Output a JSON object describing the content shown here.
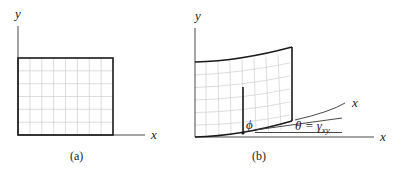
{
  "figure": {
    "panel_a": {
      "caption": "(a)",
      "x_axis_label": "x",
      "y_axis_label": "y",
      "grid": {
        "columns": 8,
        "rows": 6
      }
    },
    "panel_b": {
      "caption": "(b)",
      "x_axis_label": "x",
      "y_axis_label": "y",
      "rotated_x_label": "x",
      "phi_label": "ϕ",
      "theta_label": "θ = γ",
      "theta_subscript": "xy",
      "grid": {
        "columns": 8,
        "rows": 6
      }
    },
    "colors": {
      "line": "#1a1a1a",
      "grid": "#c8c8c8",
      "background": "#ffffff"
    }
  }
}
